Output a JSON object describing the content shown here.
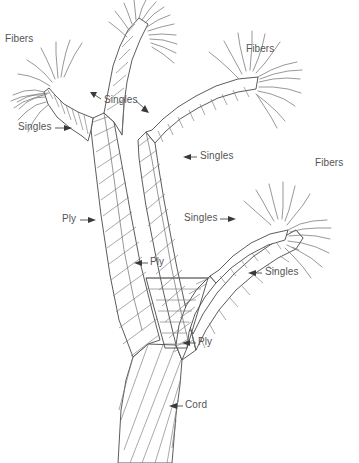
{
  "figure": {
    "name": "yarn-cord-construction-diagram",
    "background_color": "#ffffff",
    "line_color": "#4a4a4a",
    "label_color": "#555555"
  },
  "labels": [
    {
      "id": "fibers-top-left",
      "text": "Fibers",
      "x": 5,
      "y": 33,
      "arrow": "none"
    },
    {
      "id": "fibers-top-right",
      "text": "Fibers",
      "x": 246,
      "y": 43,
      "arrow": "none"
    },
    {
      "id": "fibers-mid-right",
      "text": "Fibers",
      "x": 315,
      "y": 157,
      "arrow": "none"
    },
    {
      "id": "singles-left",
      "text": "Singles",
      "x": 18,
      "y": 121,
      "arrow": "right"
    },
    {
      "id": "singles-upper-mid",
      "text": "Singles",
      "x": 104,
      "y": 94,
      "arrow": "both"
    },
    {
      "id": "singles-right-upper",
      "text": "Singles",
      "x": 200,
      "y": 150,
      "arrow": "left"
    },
    {
      "id": "singles-mid",
      "text": "Singles",
      "x": 184,
      "y": 212,
      "arrow": "right"
    },
    {
      "id": "singles-lower-right",
      "text": "Singles",
      "x": 265,
      "y": 266,
      "arrow": "left"
    },
    {
      "id": "ply-left",
      "text": "Ply",
      "x": 62,
      "y": 213,
      "arrow": "right"
    },
    {
      "id": "ply-mid",
      "text": "Ply",
      "x": 150,
      "y": 256,
      "arrow": "left"
    },
    {
      "id": "ply-lower",
      "text": "Ply",
      "x": 198,
      "y": 336,
      "arrow": "left"
    },
    {
      "id": "cord-bottom",
      "text": "Cord",
      "x": 185,
      "y": 399,
      "arrow": "left"
    }
  ],
  "hierarchy": {
    "levels": [
      "Fibers",
      "Singles",
      "Ply",
      "Cord"
    ],
    "description": "Fibers twist into singles, singles twist into ply, ply twist into cord"
  }
}
